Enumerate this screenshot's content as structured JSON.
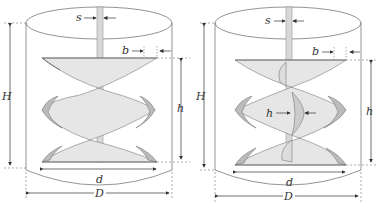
{
  "figure": {
    "panels": [
      {
        "name": "left-impeller",
        "labels": {
          "s": "s",
          "b": "b",
          "H": "H",
          "h": "h",
          "d": "d",
          "D": "D"
        }
      },
      {
        "name": "right-impeller",
        "labels": {
          "s": "s",
          "b": "b",
          "H": "H",
          "h": "h",
          "h_inner": "h",
          "d": "d",
          "D": "D"
        }
      }
    ]
  }
}
